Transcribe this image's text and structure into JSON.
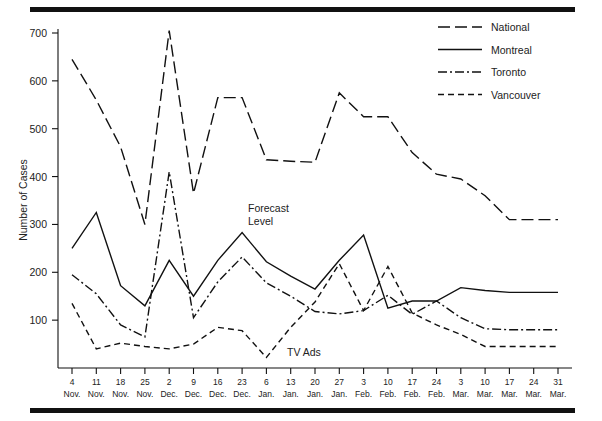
{
  "figure": {
    "top_rule": "horizontal-rule",
    "bottom_rule": "horizontal-rule"
  },
  "axes": {
    "ylabel": "Number of Cases",
    "yticks": [
      100,
      200,
      300,
      400,
      500,
      600,
      700
    ],
    "ymin": 0,
    "ymax": 730,
    "xlabels_day": [
      "4",
      "11",
      "18",
      "25",
      "2",
      "9",
      "16",
      "23",
      "6",
      "13",
      "20",
      "27",
      "3",
      "10",
      "17",
      "24",
      "3",
      "10",
      "17",
      "24",
      "31"
    ],
    "xlabels_month": [
      "Nov.",
      "Nov.",
      "Nov.",
      "Nov.",
      "Dec.",
      "Dec.",
      "Dec.",
      "Dec.",
      "Jan.",
      "Jan.",
      "Jan.",
      "Jan.",
      "Feb.",
      "Feb.",
      "Feb.",
      "Feb.",
      "Mar.",
      "Mar.",
      "Mar.",
      "Mar.",
      "Mar."
    ]
  },
  "legend": {
    "position": "top-right",
    "entries": [
      {
        "label": "National",
        "dash": "long-dash",
        "pattern": "12,5"
      },
      {
        "label": "Montreal",
        "dash": "solid",
        "pattern": "none"
      },
      {
        "label": "Toronto",
        "dash": "dash-dot",
        "pattern": "9,3,2,3"
      },
      {
        "label": "Vancouver",
        "dash": "short-dash",
        "pattern": "6,4"
      }
    ]
  },
  "annotations": [
    {
      "name": "forecast-level",
      "line1": "Forecast",
      "line2": "Level",
      "x": 248,
      "y": 212
    },
    {
      "name": "tv-ads",
      "line1": "TV Ads",
      "line2": "",
      "x": 287,
      "y": 356
    }
  ],
  "chart_data": {
    "type": "line",
    "title": "",
    "xlabel": "",
    "ylabel": "Number of Cases",
    "ylim": [
      0,
      730
    ],
    "grid": false,
    "legend_position": "top-right",
    "categories": [
      "4 Nov.",
      "11 Nov.",
      "18 Nov.",
      "25 Nov.",
      "2 Dec.",
      "9 Dec.",
      "16 Dec.",
      "23 Dec.",
      "6 Jan.",
      "13 Jan.",
      "20 Jan.",
      "27 Jan.",
      "3 Feb.",
      "10 Feb.",
      "17 Feb.",
      "24 Feb.",
      "3 Mar.",
      "10 Mar.",
      "17 Mar.",
      "24 Mar.",
      "31 Mar."
    ],
    "series": [
      {
        "name": "National",
        "style": "long-dash",
        "values": [
          645,
          560,
          462,
          300,
          705,
          365,
          565,
          565,
          435,
          432,
          430,
          575,
          525,
          525,
          450,
          405,
          395,
          360,
          310,
          310,
          310
        ]
      },
      {
        "name": "Montreal",
        "style": "solid",
        "values": [
          250,
          325,
          172,
          130,
          225,
          150,
          225,
          283,
          222,
          192,
          165,
          225,
          278,
          125,
          140,
          140,
          168,
          162,
          158,
          158,
          158
        ]
      },
      {
        "name": "Toronto",
        "style": "dash-dot",
        "values": [
          195,
          155,
          90,
          65,
          410,
          105,
          180,
          232,
          178,
          150,
          118,
          113,
          120,
          152,
          112,
          140,
          105,
          82,
          80,
          80,
          80
        ]
      },
      {
        "name": "Vancouver",
        "style": "short-dash",
        "values": [
          135,
          40,
          52,
          45,
          40,
          50,
          85,
          78,
          22,
          85,
          138,
          218,
          120,
          212,
          115,
          90,
          70,
          45,
          45,
          45,
          45
        ]
      }
    ]
  }
}
